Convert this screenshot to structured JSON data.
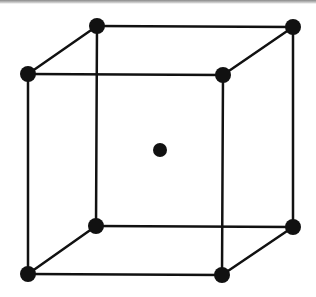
{
  "diagram": {
    "type": "body-centered-cubic-unit-cell",
    "colors": {
      "edge": "#111111",
      "atom": "#111111",
      "background": "#ffffff",
      "top_border": "#8a8a8a"
    },
    "atoms": {
      "back_top_left": {
        "x": 97,
        "y": 26
      },
      "back_top_right": {
        "x": 293,
        "y": 27
      },
      "front_top_left": {
        "x": 28,
        "y": 74
      },
      "front_top_right": {
        "x": 223,
        "y": 75
      },
      "back_bottom_left": {
        "x": 96,
        "y": 226
      },
      "back_bottom_right": {
        "x": 293,
        "y": 227
      },
      "front_bottom_left": {
        "x": 28,
        "y": 274
      },
      "front_bottom_right": {
        "x": 222,
        "y": 275
      },
      "body_center": {
        "x": 160,
        "y": 150
      }
    },
    "atom_radius": 8,
    "edge_width": 2.5
  }
}
